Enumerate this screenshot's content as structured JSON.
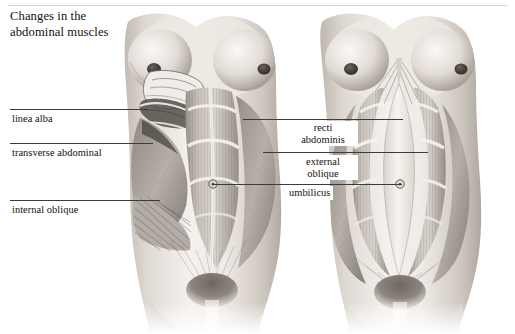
{
  "figure": {
    "title": "Changes in the\nabdominal muscles",
    "title_line1": "Changes in the",
    "title_line2": "abdominal muscles",
    "panels": [
      {
        "name": "left-figure",
        "description": "normal abdominal wall with dissection flap"
      },
      {
        "name": "right-figure",
        "description": "pregnancy diastasis recti separation"
      }
    ]
  },
  "labels": {
    "linea_alba": "linea alba",
    "transverse_abdominal": "transverse abdominal",
    "internal_oblique": "internal oblique",
    "recti_abdominis_line1": "recti",
    "recti_abdominis_line2": "abdominis",
    "external_oblique_line1": "external",
    "external_oblique_line2": "oblique",
    "umbilicus": "umbilicus"
  },
  "colors": {
    "ink": "#14100e",
    "rule": "#8d8d8d",
    "leader": "#3b3b3b",
    "paper": "#ffffff",
    "flesh_light": "#f2efec",
    "flesh_mid": "#c9c2bb",
    "flesh_shadow": "#8e8880",
    "muscle_dark": "#6f6862"
  }
}
